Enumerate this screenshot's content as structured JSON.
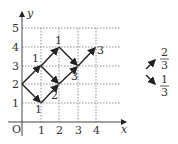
{
  "diagram": {
    "axes": {
      "x_label": "x",
      "y_label": "y",
      "origin_label": "O",
      "x_ticks": [
        "1",
        "2",
        "3",
        "4"
      ],
      "y_ticks": [
        "1",
        "2",
        "3",
        "4",
        "5"
      ]
    },
    "edge_labels": {
      "a": "1",
      "b": "1",
      "c": "1",
      "d": "2",
      "e": "3",
      "f": "3"
    },
    "legend": {
      "up_right": {
        "numerator": "2",
        "denominator": "3"
      },
      "down_right": {
        "numerator": "1",
        "denominator": "3"
      }
    }
  }
}
